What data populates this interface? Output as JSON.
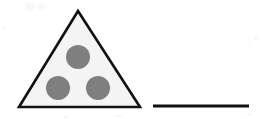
{
  "figure": {
    "background_color": "#ffffff",
    "canvas": {
      "width": 261,
      "height": 119
    },
    "shapes": {
      "triangle": {
        "name": "triangle-shape",
        "fill_color": "#f4f4f4",
        "stroke_color": "#111111",
        "stroke_width": 2.6,
        "apex": {
          "x": 78,
          "y": 11
        },
        "bottom_left": {
          "x": 19,
          "y": 107
        },
        "bottom_right": {
          "x": 140,
          "y": 107
        },
        "points": "78,11 140,107 19,107"
      },
      "dots": {
        "name": "dot-group",
        "count": 3,
        "fill_color": "#7f7f7f",
        "radius": 12,
        "items": [
          {
            "label": "top-dot",
            "cx": 78,
            "cy": 57
          },
          {
            "label": "bottom-left-dot",
            "cx": 58,
            "cy": 88
          },
          {
            "label": "bottom-right-dot",
            "cx": 98,
            "cy": 88
          }
        ]
      },
      "answer_line": {
        "name": "answer-line",
        "stroke_color": "#111111",
        "stroke_width": 3,
        "x1": 153,
        "x2": 249,
        "y": 106
      }
    }
  }
}
